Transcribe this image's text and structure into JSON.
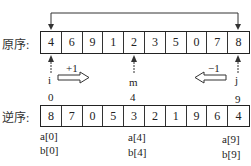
{
  "original": {
    "label": "原序:",
    "values": [
      "4",
      "6",
      "9",
      "1",
      "2",
      "3",
      "5",
      "0",
      "7",
      "8"
    ],
    "swap_connector": "swap-first-last"
  },
  "pointers": {
    "i": {
      "label": "i",
      "step": "+1"
    },
    "m": {
      "label": "m"
    },
    "j": {
      "label": "j",
      "step": "−1"
    }
  },
  "reversed": {
    "label": "逆序:",
    "values": [
      "8",
      "7",
      "0",
      "5",
      "3",
      "2",
      "1",
      "9",
      "6",
      "4"
    ],
    "indices": {
      "first": "0",
      "middle": "4",
      "last": "9"
    },
    "annotations": {
      "first": [
        "a[0]",
        "b[0]"
      ],
      "middle": [
        "a[4]",
        "b[4]"
      ],
      "last": [
        "a[9]",
        "b[9]"
      ]
    }
  }
}
